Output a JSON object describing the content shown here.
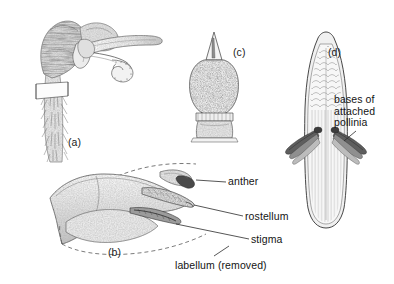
{
  "figure": {
    "background_color": "#ffffff",
    "ink_color": "#1a1a1a",
    "width": 394,
    "height": 284
  },
  "panels": [
    {
      "id": "a",
      "tag": "(a)",
      "subject": "moth head in profile with coiled proboscis and hairy leg",
      "tag_x": 68,
      "tag_y": 137
    },
    {
      "id": "b",
      "tag": "(b)",
      "subject": "orchid column in side view with labellum removed",
      "tag_x": 108,
      "tag_y": 247
    },
    {
      "id": "c",
      "tag": "(c)",
      "subject": "pollinium with viscidium, front view",
      "tag_x": 233,
      "tag_y": 47
    },
    {
      "id": "d",
      "tag": "(d)",
      "subject": "moth proboscis tip bearing attached pollinia",
      "tag_x": 328,
      "tag_y": 47
    }
  ],
  "annotations": [
    {
      "name": "bases-of-attached-pollinia",
      "lines": [
        "bases of",
        "attached",
        "pollinia"
      ],
      "text_x": 334,
      "text_y": 94,
      "leader": "M 356 131 L 344 141"
    },
    {
      "name": "anther",
      "lines": [
        "anther"
      ],
      "text_x": 228,
      "text_y": 176,
      "leader": "M 226 182 L 196 180"
    },
    {
      "name": "rostellum",
      "lines": [
        "rostellum"
      ],
      "text_x": 245,
      "text_y": 211,
      "leader": "M 243 217 L 196 203"
    },
    {
      "name": "stigma",
      "lines": [
        "stigma"
      ],
      "text_x": 251,
      "text_y": 234,
      "leader": "M 249 240 L 175 226"
    },
    {
      "name": "labellum-removed",
      "lines": [
        "labellum (removed)"
      ],
      "text_x": 175,
      "text_y": 260,
      "leader": "M 215 256 L 228 246"
    }
  ],
  "colors": {
    "ink": "#1a1a1a",
    "line": "#2b2b2b",
    "shade_light": "#d8d8d8",
    "shade_mid": "#b4b4b4",
    "shade_dark": "#7a7a7a",
    "paper": "#ffffff"
  }
}
